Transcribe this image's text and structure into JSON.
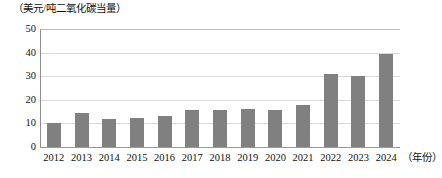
{
  "chart_data": {
    "type": "bar",
    "title": "",
    "ylabel": "（美元/吨二氧化碳当量）",
    "xlabel": "（年份）",
    "categories": [
      "2012",
      "2013",
      "2014",
      "2015",
      "2016",
      "2017",
      "2018",
      "2019",
      "2020",
      "2021",
      "2022",
      "2023",
      "2024"
    ],
    "values": [
      10,
      14.5,
      12,
      12.5,
      13,
      15.5,
      15.5,
      16,
      15.5,
      18,
      31,
      30,
      39.5
    ],
    "ylim": [
      0,
      50
    ],
    "yticks": [
      "0",
      "10",
      "20",
      "30",
      "40",
      "50"
    ],
    "ytick_values": [
      0,
      10,
      20,
      30,
      40,
      50
    ],
    "grid": true,
    "legend": "none",
    "series_color": "#808080"
  }
}
